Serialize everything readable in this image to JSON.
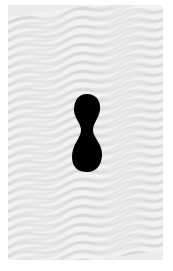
{
  "image": {
    "description": "Wavy gray moire stripe pattern with a black peanut-shaped silhouette in the center",
    "colors": {
      "background": "#ffffff",
      "stripe_light": "#f4f4f4",
      "stripe_dark": "#d6d6d6",
      "shape": "#000000"
    },
    "shape": "peanut-silhouette"
  }
}
